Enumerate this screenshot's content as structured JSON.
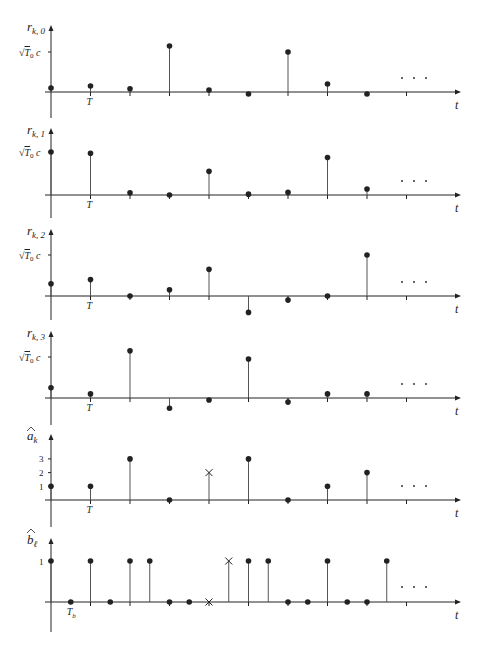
{
  "figure": {
    "time_axis_label": "t",
    "ellipsis": ". . .",
    "colors": {
      "ink": "#222222",
      "stem": "#555555",
      "background": "#ffffff"
    }
  },
  "chart_data": [
    {
      "type": "stem",
      "name": "r_k0",
      "ylabel": "r_{k,0}",
      "ytick_label": "√T0 c",
      "xlabel": "t",
      "xtick_label": "T",
      "x": [
        0,
        1,
        2,
        3,
        4,
        5,
        6,
        7,
        8
      ],
      "values": [
        0.1,
        0.15,
        0.08,
        1.15,
        0.05,
        -0.05,
        1.0,
        0.2,
        -0.05
      ]
    },
    {
      "type": "stem",
      "name": "r_k1",
      "ylabel": "r_{k,1}",
      "ytick_label": "√T0 c",
      "xlabel": "t",
      "xtick_label": "T",
      "x": [
        0,
        1,
        2,
        3,
        4,
        5,
        6,
        7,
        8
      ],
      "values": [
        1.0,
        0.97,
        0.05,
        0.0,
        0.55,
        0.02,
        0.06,
        0.87,
        0.14
      ]
    },
    {
      "type": "stem",
      "name": "r_k2",
      "ylabel": "r_{k,2}",
      "ytick_label": "√T0 c",
      "xlabel": "t",
      "xtick_label": "T",
      "x": [
        0,
        1,
        2,
        3,
        4,
        5,
        6,
        7,
        8
      ],
      "values": [
        0.3,
        0.4,
        0.0,
        0.15,
        0.65,
        -0.4,
        -0.1,
        0.0,
        1.0
      ]
    },
    {
      "type": "stem",
      "name": "r_k3",
      "ylabel": "r_{k,3}",
      "ytick_label": "√T0 c",
      "xlabel": "t",
      "xtick_label": "T",
      "x": [
        0,
        1,
        2,
        3,
        4,
        5,
        6,
        7,
        8
      ],
      "values": [
        0.25,
        0.1,
        1.15,
        -0.25,
        -0.05,
        0.95,
        -0.1,
        0.1,
        0.1
      ]
    },
    {
      "type": "stem",
      "name": "a_hat_k",
      "ylabel": "â_k",
      "yticks": [
        1,
        2,
        3
      ],
      "xlabel": "t",
      "xtick_label": "T",
      "x": [
        0,
        1,
        2,
        3,
        4,
        5,
        6,
        7,
        8
      ],
      "values": [
        1,
        1,
        3,
        0,
        2,
        3,
        0,
        1,
        2
      ],
      "markers": [
        "dot",
        "dot",
        "dot",
        "dot",
        "cross",
        "dot",
        "dot",
        "dot",
        "dot"
      ]
    },
    {
      "type": "stem",
      "name": "b_hat_l",
      "ylabel": "b̂_ℓ",
      "yticks": [
        1
      ],
      "xlabel": "t",
      "xtick_label": "Tb",
      "x": [
        0,
        1,
        2,
        3,
        4,
        5,
        6,
        7,
        8,
        9,
        10,
        11,
        12,
        13,
        14,
        15,
        16,
        17
      ],
      "values": [
        1,
        0,
        1,
        0,
        1,
        1,
        0,
        0,
        0,
        1,
        1,
        1,
        0,
        0,
        1,
        0,
        0,
        1
      ],
      "markers": [
        "dot",
        "dot",
        "dot",
        "dot",
        "dot",
        "dot",
        "dot",
        "dot",
        "cross",
        "cross",
        "dot",
        "dot",
        "dot",
        "dot",
        "dot",
        "dot",
        "dot",
        "dot"
      ]
    }
  ]
}
